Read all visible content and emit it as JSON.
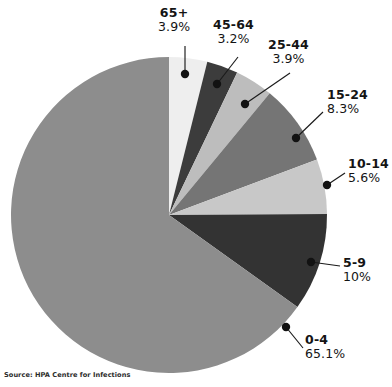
{
  "chart_data": {
    "type": "pie",
    "title": "",
    "subtitle": "",
    "xlabel": "",
    "ylabel": "",
    "legend_position": "none",
    "grid": false,
    "start_angle_deg": 0,
    "direction": "clockwise",
    "categories": [
      "65+",
      "45-64",
      "25-44",
      "15-24",
      "10-14",
      "5-9",
      "0-4"
    ],
    "values": [
      3.9,
      3.2,
      3.9,
      8.3,
      5.6,
      10.0,
      65.1
    ],
    "value_labels": [
      "3.9%",
      "3.2%",
      "3.9%",
      "8.3%",
      "5.6%",
      "10%",
      "65.1%"
    ],
    "colors": [
      "#eeeeee",
      "#3c3c3c",
      "#bdbdbd",
      "#757575",
      "#c8c8c8",
      "#333333",
      "#8d8d8d"
    ],
    "unit": "%",
    "slices": [
      {
        "label": "65+",
        "value": 3.9,
        "value_label": "3.9%",
        "color": "#eeeeee"
      },
      {
        "label": "45-64",
        "value": 3.2,
        "value_label": "3.2%",
        "color": "#3c3c3c"
      },
      {
        "label": "25-44",
        "value": 3.9,
        "value_label": "3.9%",
        "color": "#bdbdbd"
      },
      {
        "label": "15-24",
        "value": 8.3,
        "value_label": "8.3%",
        "color": "#757575"
      },
      {
        "label": "10-14",
        "value": 5.6,
        "value_label": "5.6%",
        "color": "#c8c8c8"
      },
      {
        "label": "5-9",
        "value": 10.0,
        "value_label": "10%",
        "color": "#333333"
      },
      {
        "label": "0-4",
        "value": 65.1,
        "value_label": "65.1%",
        "color": "#8d8d8d"
      }
    ]
  },
  "callouts": [
    {
      "name": "callout-65-plus",
      "category": "65+",
      "percent": "3.9%",
      "align": "center",
      "left": 158,
      "top": 6,
      "dot_x": 185,
      "dot_y": 74,
      "elbow_x": 185,
      "elbow_y": 46,
      "end_x": 185,
      "end_y": 46
    },
    {
      "name": "callout-45-64",
      "category": "45-64",
      "percent": "3.2%",
      "align": "center",
      "left": 213,
      "top": 18,
      "dot_x": 217,
      "dot_y": 84,
      "elbow_x": 238,
      "elbow_y": 57,
      "end_x": 238,
      "end_y": 57
    },
    {
      "name": "callout-25-44",
      "category": "25-44",
      "percent": "3.9%",
      "align": "center",
      "left": 268,
      "top": 38,
      "dot_x": 245,
      "dot_y": 104,
      "elbow_x": 290,
      "elbow_y": 73,
      "end_x": 290,
      "end_y": 73
    },
    {
      "name": "callout-15-24",
      "category": "15-24",
      "percent": "8.3%",
      "align": "left",
      "left": 327,
      "top": 88,
      "dot_x": 296,
      "dot_y": 138,
      "elbow_x": 323,
      "elbow_y": 112,
      "end_x": 323,
      "end_y": 112
    },
    {
      "name": "callout-10-14",
      "category": "10-14",
      "percent": "5.6%",
      "align": "left",
      "left": 348,
      "top": 157,
      "dot_x": 327,
      "dot_y": 185,
      "elbow_x": 345,
      "elbow_y": 173,
      "end_x": 345,
      "end_y": 173
    },
    {
      "name": "callout-5-9",
      "category": "5-9",
      "percent": "10%",
      "align": "left",
      "left": 343,
      "top": 256,
      "dot_x": 311,
      "dot_y": 262,
      "elbow_x": 340,
      "elbow_y": 266,
      "end_x": 340,
      "end_y": 266
    },
    {
      "name": "callout-0-4",
      "category": "0-4",
      "percent": "65.1%",
      "align": "left",
      "left": 305,
      "top": 333,
      "dot_x": 286,
      "dot_y": 327,
      "elbow_x": 303,
      "elbow_y": 348,
      "end_x": 303,
      "end_y": 348
    }
  ],
  "geometry": {
    "cx": 169,
    "cy": 215,
    "r": 158
  },
  "source_note": "Source: HPA Centre for Infections"
}
